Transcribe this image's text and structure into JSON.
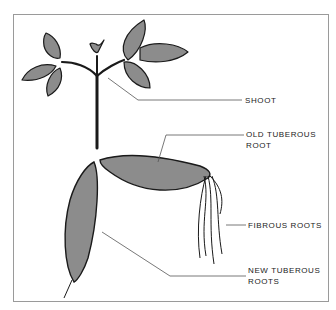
{
  "diagram": {
    "labels": {
      "shoot": "SHOOT",
      "old_tuberous_root_line1": "OLD TUBEROUS",
      "old_tuberous_root_line2": "ROOT",
      "fibrous_roots": "FIBROUS ROOTS",
      "new_tuberous_roots_line1": "NEW TUBEROUS",
      "new_tuberous_roots_line2": "ROOTS"
    },
    "colors": {
      "fill": "#8c8c8c",
      "outline": "#1a1a1a",
      "frame": "#9a9a9a"
    }
  }
}
